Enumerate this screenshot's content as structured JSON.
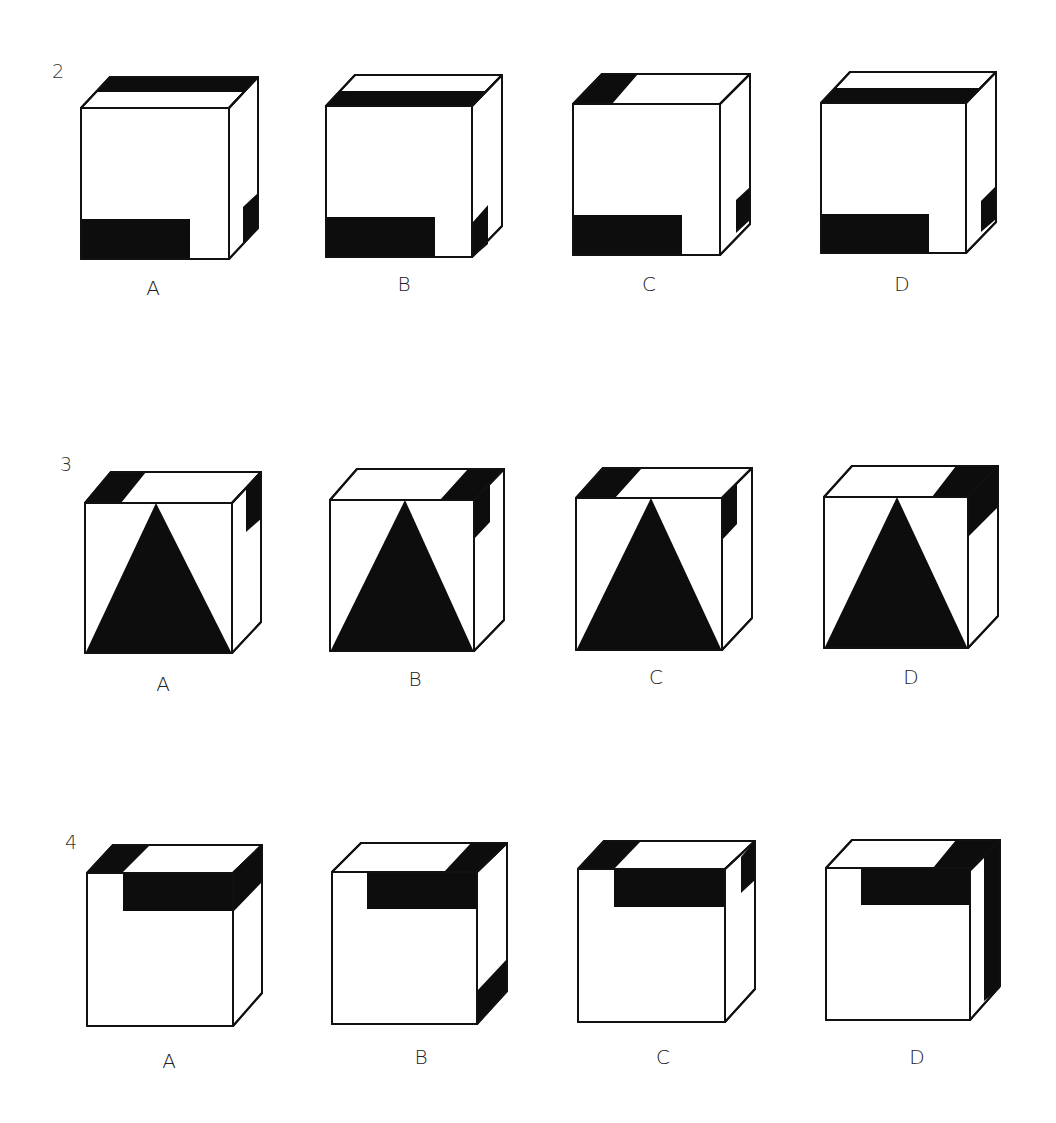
{
  "questions": [
    {
      "number": "2",
      "options": [
        {
          "label": "A",
          "front": "bottom-left black bar",
          "top": "black strip along back edge",
          "side": "small black patch lower right"
        },
        {
          "label": "B",
          "front": "bottom-left black bar",
          "top": "black strip along front edge",
          "side": "small black patch lower left"
        },
        {
          "label": "C",
          "front": "bottom-left black bar",
          "top": "black patch left corner",
          "side": "small black patch lower middle"
        },
        {
          "label": "D",
          "front": "bottom-left black bar",
          "top": "black strip along front edge",
          "side": "small black patch lower middle"
        }
      ]
    },
    {
      "number": "3",
      "options": [
        {
          "label": "A",
          "front": "black triangle",
          "top": "black patch left corner",
          "side": "black patch upper right"
        },
        {
          "label": "B",
          "front": "black triangle",
          "top": "black patch right corner",
          "side": "black patch upper left continuing from top"
        },
        {
          "label": "C",
          "front": "black triangle",
          "top": "black patch left corner",
          "side": "black patch upper left"
        },
        {
          "label": "D",
          "front": "black triangle",
          "top": "black patch right corner",
          "side": "black patch upper continuing from top"
        }
      ]
    },
    {
      "number": "4",
      "options": [
        {
          "label": "A",
          "front": "black band at top right",
          "top": "black strips at left corner and right side",
          "side": "black top portion"
        },
        {
          "label": "B",
          "front": "black band at top right",
          "top": "black patch right corner",
          "side": "black patch bottom"
        },
        {
          "label": "C",
          "front": "black band at top right",
          "top": "black patch left corner",
          "side": "black patch upper right"
        },
        {
          "label": "D",
          "front": "black band at top right",
          "top": "black patch right corner",
          "side": "black vertical strip full height"
        }
      ]
    }
  ]
}
